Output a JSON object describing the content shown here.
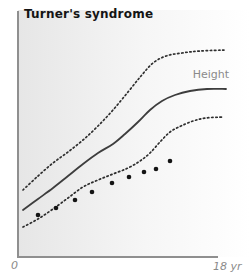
{
  "title": "Turner's syndrome",
  "curve_label": "Height",
  "x_axis": {
    "origin_label": "0",
    "max_label": "18 yr"
  },
  "colors": {
    "background": "#ffffff",
    "panel_left": "#e6e6e6",
    "panel_mid": "#f6f6f6",
    "panel_right": "#ffffff",
    "axis": "#8f8f8f",
    "dotted_curve": "#2e2e2e",
    "solid_curve": "#3d3d3d",
    "patient_dots": "#141414",
    "muted_text": "#8a8a8a",
    "title_text": "#141414"
  },
  "chart_data": {
    "type": "line",
    "title": "Turner's syndrome",
    "xlabel": "age (years)",
    "x_tick_labels": [
      "0",
      "18 yr"
    ],
    "x_range_years": [
      0,
      18
    ],
    "ylabel": "Height (axis unlabeled, increasing upward)",
    "grid": false,
    "legend_position": "none (solid curve annotated 'Height' in-plot)",
    "axes_px": {
      "y_axis_x": 18,
      "y_axis_top": 11,
      "x_axis_y": 257,
      "x_axis_left": 18,
      "x_axis_right": 218
    },
    "series": [
      {
        "name": "upper reference centile",
        "style": "dotted",
        "points_px": [
          [
            23,
            190
          ],
          [
            38,
            176
          ],
          [
            53,
            163
          ],
          [
            68,
            152
          ],
          [
            83,
            140
          ],
          [
            98,
            126
          ],
          [
            113,
            110
          ],
          [
            128,
            92
          ],
          [
            141,
            76
          ],
          [
            153,
            63
          ],
          [
            166,
            56
          ],
          [
            182,
            53
          ],
          [
            200,
            51
          ],
          [
            226,
            50
          ]
        ]
      },
      {
        "name": "median height",
        "label": "Height",
        "style": "solid",
        "points_px": [
          [
            23,
            210
          ],
          [
            38,
            199
          ],
          [
            53,
            188
          ],
          [
            68,
            176
          ],
          [
            83,
            164
          ],
          [
            98,
            153
          ],
          [
            113,
            144
          ],
          [
            125,
            134
          ],
          [
            138,
            122
          ],
          [
            150,
            110
          ],
          [
            162,
            101
          ],
          [
            175,
            95
          ],
          [
            190,
            91
          ],
          [
            207,
            89
          ],
          [
            226,
            89
          ]
        ]
      },
      {
        "name": "lower reference centile",
        "style": "dotted",
        "points_px": [
          [
            23,
            227
          ],
          [
            38,
            219
          ],
          [
            53,
            209
          ],
          [
            68,
            198
          ],
          [
            83,
            187
          ],
          [
            98,
            180
          ],
          [
            113,
            174
          ],
          [
            128,
            168
          ],
          [
            140,
            161
          ],
          [
            150,
            153
          ],
          [
            160,
            142
          ],
          [
            170,
            132
          ],
          [
            181,
            126
          ],
          [
            193,
            121
          ],
          [
            206,
            118
          ],
          [
            223,
            117
          ]
        ]
      }
    ],
    "scatter": {
      "name": "patient height measurements",
      "style": "filled black dots",
      "dot_radius_px": 2.3,
      "points_px": [
        [
          38,
          215
        ],
        [
          56,
          208
        ],
        [
          75,
          200
        ],
        [
          92,
          192
        ],
        [
          112,
          183
        ],
        [
          129,
          177
        ],
        [
          144,
          172
        ],
        [
          156,
          169
        ],
        [
          170,
          161
        ]
      ],
      "x_years_approx": [
        1.8,
        3.4,
        5.1,
        6.7,
        8.5,
        10.0,
        11.3,
        12.4,
        13.7
      ]
    }
  }
}
